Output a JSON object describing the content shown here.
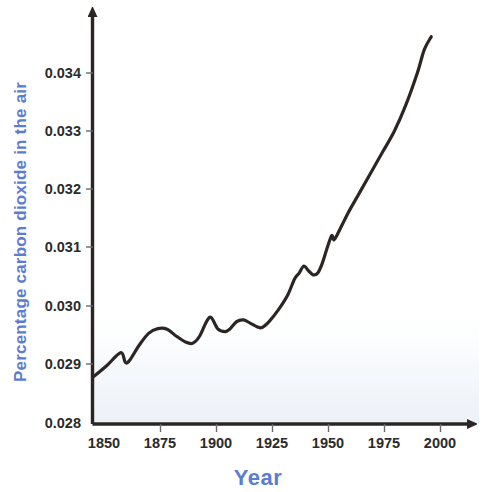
{
  "chart_data": {
    "type": "line",
    "title": "",
    "xlabel": "Year",
    "ylabel": "Percentage carbon dioxide in the air",
    "xlim": [
      1850,
      2008
    ],
    "ylim": [
      0.028,
      0.0348
    ],
    "grid": false,
    "legend": "none",
    "xticks": [
      1850,
      1875,
      1900,
      1925,
      1950,
      1975,
      2000
    ],
    "xtick_labels": [
      "1850",
      "1875",
      "1900",
      "1925",
      "1950",
      "1975",
      "2000"
    ],
    "yticks": [
      0.028,
      0.029,
      0.03,
      0.031,
      0.032,
      0.033,
      0.034
    ],
    "ytick_labels": [
      "0.028",
      "0.029",
      "0.030",
      "0.031",
      "0.032",
      "0.033",
      "0.034"
    ],
    "series": [
      {
        "name": "Percentage carbon dioxide in the air",
        "color": "#2b2623",
        "x": [
          1850,
          1856,
          1862,
          1864,
          1866,
          1870,
          1874,
          1878,
          1882,
          1886,
          1890,
          1893,
          1896,
          1899,
          1901,
          1904,
          1907,
          1909,
          1912,
          1915,
          1918,
          1921,
          1923,
          1926,
          1930,
          1934,
          1937,
          1939,
          1941,
          1943,
          1945,
          1947,
          1949,
          1951,
          1953,
          1954,
          1956,
          1960,
          1965,
          1970,
          1975,
          1980,
          1985,
          1990,
          1993,
          1996
        ],
        "y": [
          0.0288,
          0.029,
          0.02922,
          0.02905,
          0.0291,
          0.02935,
          0.02955,
          0.02963,
          0.02962,
          0.0295,
          0.0294,
          0.02938,
          0.0295,
          0.02975,
          0.02982,
          0.02962,
          0.02958,
          0.02962,
          0.02975,
          0.02978,
          0.02972,
          0.02966,
          0.02965,
          0.02975,
          0.02995,
          0.0302,
          0.03048,
          0.03058,
          0.0307,
          0.03062,
          0.03055,
          0.03058,
          0.03075,
          0.031,
          0.03122,
          0.03115,
          0.03128,
          0.0316,
          0.03195,
          0.0323,
          0.03265,
          0.033,
          0.03345,
          0.034,
          0.0344,
          0.03462
        ]
      }
    ]
  },
  "axes": {
    "x_axis_name": "x-axis",
    "y_axis_name": "y-axis"
  }
}
